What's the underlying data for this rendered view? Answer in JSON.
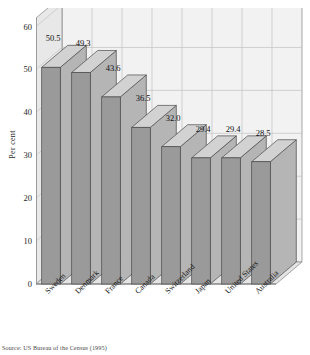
{
  "chart_data": {
    "type": "bar",
    "title": "",
    "xlabel": "",
    "ylabel": "Per cent",
    "categories": [
      "Sweden",
      "Denmark",
      "France",
      "Canada",
      "Switzerland",
      "Japan",
      "United States",
      "Australia"
    ],
    "values": [
      50.5,
      49.3,
      43.6,
      36.5,
      32.0,
      29.4,
      29.4,
      28.5
    ],
    "value_labels": [
      "50.5",
      "49.3",
      "43.6",
      "36.5",
      "32.0",
      "29.4",
      "29.4",
      "28.5"
    ],
    "ylim": [
      0,
      62
    ],
    "yticks": [
      0,
      10,
      20,
      30,
      40,
      50,
      60
    ],
    "ytick_labels": [
      "0",
      "10",
      "20",
      "30",
      "40",
      "50",
      "60"
    ],
    "grid": true,
    "legend": "none",
    "style": "3d-column",
    "colors": {
      "bar_front": "#9a9a9a",
      "bar_top": "#d2d2d2",
      "bar_side": "#b5b5b5",
      "bar_edge": "#4a4a4a",
      "wall": "#f2f2f2",
      "wall_side": "#e8e8e8",
      "floor": "#e4e4e4",
      "grid": "#c2c2c2",
      "axis": "#6e6e6e",
      "text": "#1a1a1a"
    }
  },
  "source_note": "Source: US Bureau of the Census (1995)"
}
